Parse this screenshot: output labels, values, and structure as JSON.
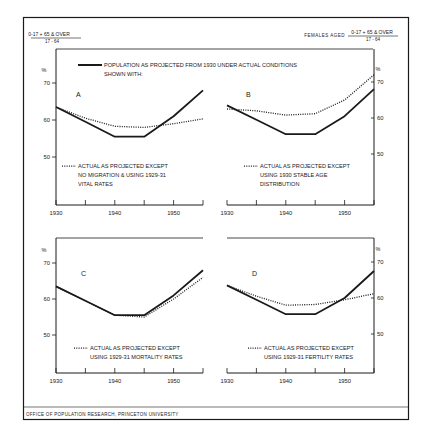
{
  "header": {
    "left_ratio_numerator": "0-17 + 65 & OVER",
    "left_ratio_denominator": "17 - 64",
    "right_prefix": "FEMALES AGED",
    "right_ratio_numerator": "0-17 + 65 & OVER",
    "right_ratio_denominator": "17 - 64",
    "main_legend_line1": "POPULATION AS PROJECTED FROM 1930 UNDER ACTUAL CONDITIONS",
    "main_legend_line2": "SHOWN WITH:"
  },
  "footer": {
    "credit": "OFFICE OF POPULATION RESEARCH, PRINCETON UNIVERSITY"
  },
  "colors": {
    "ink": "#1a1a1a",
    "background": "#ffffff"
  },
  "chart_data": [
    {
      "type": "line",
      "panel": "A",
      "y_axis_side": "left",
      "ylabel": "%",
      "ylim": [
        40,
        73
      ],
      "yticks": [
        50,
        60,
        70
      ],
      "xlim": [
        1930,
        1955
      ],
      "xticks": [
        1930,
        1935,
        1940,
        1945,
        1950,
        1955
      ],
      "xtick_labels": [
        "1930",
        "1940",
        "1950"
      ],
      "x": [
        1930,
        1935,
        1940,
        1945,
        1950,
        1955
      ],
      "series": [
        {
          "name": "Population as projected from 1930 under actual conditions",
          "style": "solid",
          "values": [
            63.5,
            59.5,
            55.5,
            55.5,
            61,
            68
          ]
        },
        {
          "name": "Actual as projected except no migration & using 1929-31 vital rates",
          "style": "dotted",
          "values": [
            63.5,
            60.5,
            58.3,
            58,
            59,
            60.3
          ]
        }
      ],
      "annotation": [
        "ACTUAL AS PROJECTED EXCEPT",
        "NO MIGRATION & USING 1929-31",
        "VITAL RATES"
      ]
    },
    {
      "type": "line",
      "panel": "B",
      "y_axis_side": "right",
      "ylabel": "%",
      "ylim": [
        40,
        73
      ],
      "yticks": [
        50,
        60,
        70
      ],
      "xlim": [
        1930,
        1955
      ],
      "xticks": [
        1930,
        1935,
        1940,
        1945,
        1950,
        1955
      ],
      "xtick_labels": [
        "1930",
        "1940",
        "1950"
      ],
      "x": [
        1930,
        1935,
        1940,
        1945,
        1950,
        1955
      ],
      "series": [
        {
          "name": "Population as projected from 1930 under actual conditions",
          "style": "solid",
          "values": [
            63.5,
            59.5,
            55.5,
            55.5,
            60.5,
            68
          ]
        },
        {
          "name": "Actual as projected except using 1930 stable age distribution",
          "style": "dotted",
          "values": [
            62.5,
            62,
            60.8,
            61.2,
            65,
            72
          ]
        }
      ],
      "annotation": [
        "ACTUAL AS PROJECTED EXCEPT",
        "USING 1930 STABLE AGE",
        "DISTRIBUTION"
      ]
    },
    {
      "type": "line",
      "panel": "C",
      "y_axis_side": "left",
      "ylabel": "%",
      "ylim": [
        40,
        73
      ],
      "yticks": [
        50,
        60,
        70
      ],
      "xlim": [
        1930,
        1955
      ],
      "xticks": [
        1930,
        1935,
        1940,
        1945,
        1950,
        1955
      ],
      "xtick_labels": [
        "1930",
        "1940",
        "1950"
      ],
      "x": [
        1930,
        1935,
        1940,
        1945,
        1950,
        1955
      ],
      "series": [
        {
          "name": "Population as projected from 1930 under actual conditions",
          "style": "solid",
          "values": [
            63.5,
            59.5,
            55.5,
            55.5,
            61,
            68
          ]
        },
        {
          "name": "Actual as projected except using 1929-31 mortality rates",
          "style": "dotted",
          "values": [
            63.5,
            59.5,
            55.5,
            55,
            60,
            66
          ]
        }
      ],
      "annotation": [
        "ACTUAL AS PROJECTED EXCEPT",
        "USING 1929-31 MORTALITY RATES"
      ]
    },
    {
      "type": "line",
      "panel": "D",
      "y_axis_side": "right",
      "ylabel": "%",
      "ylim": [
        40,
        73
      ],
      "yticks": [
        50,
        60,
        70
      ],
      "xlim": [
        1930,
        1955
      ],
      "xticks": [
        1930,
        1935,
        1940,
        1945,
        1950,
        1955
      ],
      "xtick_labels": [
        "1930",
        "1940",
        "1950"
      ],
      "x": [
        1930,
        1935,
        1940,
        1945,
        1950,
        1955
      ],
      "series": [
        {
          "name": "Population as projected from 1930 under actual conditions",
          "style": "solid",
          "values": [
            63.5,
            59.5,
            55.5,
            55.5,
            60,
            67.5
          ]
        },
        {
          "name": "Actual as projected except using 1929-31 fertility rates",
          "style": "dotted",
          "values": [
            63.5,
            60.5,
            58,
            58.2,
            59.5,
            61.2
          ]
        }
      ],
      "annotation": [
        "ACTUAL AS PROJECTED EXCEPT",
        "USING 1929-31 FERTILITY RATES"
      ]
    }
  ]
}
